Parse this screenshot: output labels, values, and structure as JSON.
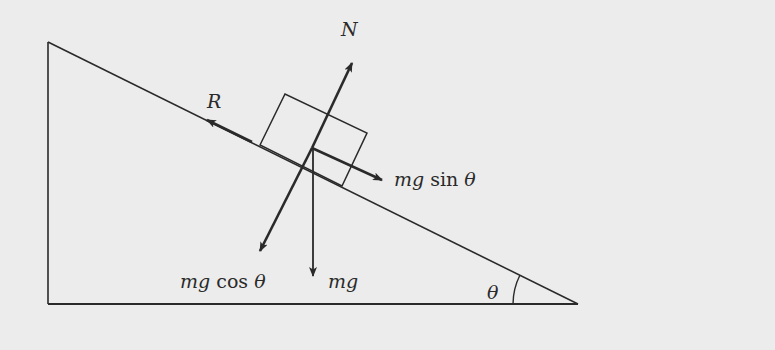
{
  "diagram": {
    "colors": {
      "background": "#ececec",
      "stroke": "#2a2a2a"
    },
    "labels": {
      "normal": "N",
      "friction": "R",
      "parallel_component_mg": "mg",
      "parallel_component_fn": "sin",
      "parallel_component_angle": "θ",
      "perpendicular_component_mg": "mg",
      "perpendicular_component_fn": "cos",
      "perpendicular_component_angle": "θ",
      "weight": "mg",
      "angle": "θ"
    },
    "forces": [
      {
        "name": "N",
        "direction": "perpendicular-up from incline"
      },
      {
        "name": "R",
        "direction": "up the incline"
      },
      {
        "name": "mg sin θ",
        "direction": "down the incline"
      },
      {
        "name": "mg cos θ",
        "direction": "perpendicular into incline"
      },
      {
        "name": "mg",
        "direction": "vertically down"
      }
    ]
  }
}
